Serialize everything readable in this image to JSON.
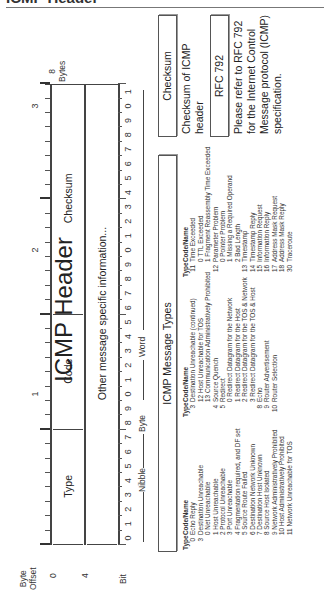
{
  "page_title": "ICMP Header",
  "diagram": {
    "title": "ICMP Header",
    "offset_header": {
      "line1": "Byte",
      "line2": "Offset"
    },
    "byte_offsets": [
      "0",
      "4"
    ],
    "bit_label": "Bit",
    "bit_numbers": [
      "0",
      "1",
      "2",
      "3",
      "4",
      "5",
      "6",
      "7",
      "8",
      "9",
      "0",
      "1",
      "2",
      "3",
      "4",
      "5",
      "6",
      "7",
      "8",
      "9",
      "0",
      "1",
      "2",
      "3",
      "4",
      "5",
      "6",
      "7",
      "8",
      "9",
      "0",
      "1"
    ],
    "decade_labels": [
      "1",
      "2",
      "3"
    ],
    "fields_row1": [
      {
        "name": "Type",
        "bits": 8
      },
      {
        "name": "Code",
        "bits": 8
      },
      {
        "name": "Checksum",
        "bits": 16
      }
    ],
    "fields_row2": [
      {
        "name": "Other message specific information...",
        "bits": 32
      }
    ],
    "width_legend": {
      "nibble": "Nibble",
      "byte": "Byte",
      "word": "Word"
    },
    "bytes_legend": {
      "value": "8",
      "label": "Bytes"
    }
  },
  "message_types": {
    "title": "ICMP Message Types",
    "column_header": {
      "type": "Type",
      "name": "Code/Name"
    },
    "columns": [
      [
        {
          "type": "0",
          "name": "Echo Reply"
        },
        {
          "type": "3",
          "name": "Destination Unreachable"
        },
        {
          "code": "0",
          "name": "Net Unreachable"
        },
        {
          "code": "1",
          "name": "Host Unreachable"
        },
        {
          "code": "2",
          "name": "Protocol Unreachable"
        },
        {
          "code": "3",
          "name": "Port Unreachable"
        },
        {
          "code": "4",
          "name": "Fragmentation required, and DF set"
        },
        {
          "code": "5",
          "name": "Source Route Failed"
        },
        {
          "code": "6",
          "name": "Destination Network Unknown"
        },
        {
          "code": "7",
          "name": "Destination Host Unknown"
        },
        {
          "code": "8",
          "name": "Source Host Isolated"
        },
        {
          "code": "9",
          "name": "Network Administratively Prohibited"
        },
        {
          "code": "10",
          "name": "Host Administratively Prohibited"
        },
        {
          "code": "11",
          "name": "Network Unreachable for TOS"
        }
      ],
      [
        {
          "type": "3",
          "name": "Destination Unreachable (continued)"
        },
        {
          "code": "12",
          "name": "Host Unreachable for TOS"
        },
        {
          "code": "13",
          "name": "Communication Administratively Prohibited"
        },
        {
          "type": "4",
          "name": "Source Quench"
        },
        {
          "type": "5",
          "name": "Redirect"
        },
        {
          "code": "0",
          "name": "Redirect Datagram for the Network"
        },
        {
          "code": "1",
          "name": "Redirect Datagram for the Host"
        },
        {
          "code": "2",
          "name": "Redirect Datagram for the TOS & Network"
        },
        {
          "code": "3",
          "name": "Redirect Datagram for the TOS & Host"
        },
        {
          "type": "8",
          "name": "Echo"
        },
        {
          "type": "9",
          "name": "Router Advertisement"
        },
        {
          "type": "10",
          "name": "Router Selection"
        }
      ],
      [
        {
          "type": "11",
          "name": "Time Exceeded"
        },
        {
          "code": "0",
          "name": "TTL Exceeded"
        },
        {
          "code": "1",
          "name": "Fragment Reassembly Time Exceeded"
        },
        {
          "type": "12",
          "name": "Parameter Problem"
        },
        {
          "code": "0",
          "name": "Pointer Problem"
        },
        {
          "code": "1",
          "name": "Missing a Required Operand"
        },
        {
          "code": "2",
          "name": "Bad Length"
        },
        {
          "type": "13",
          "name": "Timestamp"
        },
        {
          "type": "14",
          "name": "Timestamp Reply"
        },
        {
          "type": "15",
          "name": "Information Request"
        },
        {
          "type": "16",
          "name": "Information Reply"
        },
        {
          "type": "17",
          "name": "Address Mask Request"
        },
        {
          "type": "18",
          "name": "Address Mask Reply"
        },
        {
          "type": "30",
          "name": "Traceroute"
        }
      ]
    ]
  },
  "checksum_box": {
    "title": "Checksum",
    "description": "Checksum of ICMP header"
  },
  "rfc_box": {
    "title": "RFC 792",
    "description": "Please refer to RFC 792 for the Internet Control Message protocol (ICMP) specification."
  }
}
